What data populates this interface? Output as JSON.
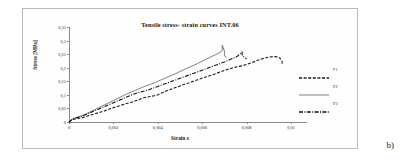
{
  "panel": {
    "label": "b)"
  },
  "chart_data": {
    "type": "line",
    "title": "Tensile stress- strain curves INT.06",
    "xlabel": "Strain ε",
    "ylabel": "Stress [MPa]",
    "xlim": [
      0,
      0.01
    ],
    "ylim": [
      0,
      0.35
    ],
    "xticks": [
      0,
      0.002,
      0.004,
      0.006,
      0.008,
      0.01
    ],
    "xtick_labels": [
      "0",
      "0,002",
      "0,004",
      "0,006",
      "0,008",
      "0,01"
    ],
    "yticks": [
      0,
      0.05,
      0.1,
      0.15,
      0.2,
      0.25,
      0.3,
      0.35
    ],
    "ytick_labels": [
      "0",
      "0,05",
      "0,1",
      "0,15",
      "0,2",
      "0,25",
      "0,3",
      "0,35"
    ],
    "grid": false,
    "legend_position": "right",
    "series": [
      {
        "name": "F1",
        "style": "dashed",
        "color": "#1a1a1a",
        "points": [
          [
            0.0,
            0.0
          ],
          [
            0.0001,
            0.006
          ],
          [
            0.0002,
            0.01
          ],
          [
            0.0004,
            0.013
          ],
          [
            0.0006,
            0.016
          ],
          [
            0.0008,
            0.021
          ],
          [
            0.001,
            0.026
          ],
          [
            0.0012,
            0.031
          ],
          [
            0.0014,
            0.036
          ],
          [
            0.0016,
            0.041
          ],
          [
            0.0018,
            0.047
          ],
          [
            0.002,
            0.053
          ],
          [
            0.0022,
            0.058
          ],
          [
            0.0024,
            0.063
          ],
          [
            0.0026,
            0.068
          ],
          [
            0.0028,
            0.072
          ],
          [
            0.003,
            0.078
          ],
          [
            0.0032,
            0.084
          ],
          [
            0.0034,
            0.09
          ],
          [
            0.0036,
            0.093
          ],
          [
            0.0038,
            0.096
          ],
          [
            0.004,
            0.1
          ],
          [
            0.0042,
            0.108
          ],
          [
            0.0044,
            0.115
          ],
          [
            0.0046,
            0.121
          ],
          [
            0.0048,
            0.127
          ],
          [
            0.005,
            0.133
          ],
          [
            0.0052,
            0.139
          ],
          [
            0.0054,
            0.144
          ],
          [
            0.0056,
            0.15
          ],
          [
            0.0058,
            0.156
          ],
          [
            0.006,
            0.162
          ],
          [
            0.0062,
            0.167
          ],
          [
            0.0064,
            0.172
          ],
          [
            0.0066,
            0.178
          ],
          [
            0.0068,
            0.184
          ],
          [
            0.007,
            0.19
          ],
          [
            0.0072,
            0.195
          ],
          [
            0.0074,
            0.2
          ],
          [
            0.0076,
            0.204
          ],
          [
            0.0078,
            0.207
          ],
          [
            0.008,
            0.212
          ],
          [
            0.0082,
            0.218
          ],
          [
            0.0084,
            0.224
          ],
          [
            0.0086,
            0.23
          ],
          [
            0.0088,
            0.235
          ],
          [
            0.009,
            0.239
          ],
          [
            0.0092,
            0.241
          ],
          [
            0.0094,
            0.24
          ],
          [
            0.0095,
            0.236
          ],
          [
            0.0096,
            0.222
          ],
          [
            0.0096,
            0.21
          ]
        ]
      },
      {
        "name": "F2",
        "style": "solid",
        "color": "#4a4a4a",
        "points": [
          [
            0.0,
            0.0
          ],
          [
            0.0001,
            0.008
          ],
          [
            0.0002,
            0.013
          ],
          [
            0.0004,
            0.018
          ],
          [
            0.0006,
            0.024
          ],
          [
            0.0008,
            0.031
          ],
          [
            0.001,
            0.039
          ],
          [
            0.0012,
            0.047
          ],
          [
            0.0014,
            0.055
          ],
          [
            0.0016,
            0.063
          ],
          [
            0.0018,
            0.071
          ],
          [
            0.002,
            0.079
          ],
          [
            0.0022,
            0.087
          ],
          [
            0.0024,
            0.095
          ],
          [
            0.0026,
            0.103
          ],
          [
            0.0028,
            0.11
          ],
          [
            0.003,
            0.117
          ],
          [
            0.0032,
            0.124
          ],
          [
            0.0034,
            0.131
          ],
          [
            0.0036,
            0.137
          ],
          [
            0.0038,
            0.143
          ],
          [
            0.004,
            0.15
          ],
          [
            0.0042,
            0.157
          ],
          [
            0.0044,
            0.164
          ],
          [
            0.0046,
            0.171
          ],
          [
            0.0048,
            0.178
          ],
          [
            0.005,
            0.186
          ],
          [
            0.0052,
            0.194
          ],
          [
            0.0054,
            0.201
          ],
          [
            0.0056,
            0.208
          ],
          [
            0.0058,
            0.216
          ],
          [
            0.006,
            0.224
          ],
          [
            0.0062,
            0.232
          ],
          [
            0.0064,
            0.24
          ],
          [
            0.0066,
            0.248
          ],
          [
            0.0068,
            0.256
          ],
          [
            0.0069,
            0.262
          ],
          [
            0.0069,
            0.283
          ],
          [
            0.007,
            0.262
          ],
          [
            0.007,
            0.244
          ],
          [
            0.0071,
            0.238
          ]
        ]
      },
      {
        "name": "F3",
        "style": "dashdot",
        "color": "#111111",
        "points": [
          [
            0.0,
            0.0
          ],
          [
            0.0001,
            0.007
          ],
          [
            0.0002,
            0.012
          ],
          [
            0.0004,
            0.017
          ],
          [
            0.0006,
            0.022
          ],
          [
            0.0008,
            0.029
          ],
          [
            0.001,
            0.036
          ],
          [
            0.0012,
            0.043
          ],
          [
            0.0014,
            0.05
          ],
          [
            0.0016,
            0.057
          ],
          [
            0.0018,
            0.064
          ],
          [
            0.002,
            0.071
          ],
          [
            0.0022,
            0.078
          ],
          [
            0.0024,
            0.085
          ],
          [
            0.0026,
            0.092
          ],
          [
            0.0028,
            0.099
          ],
          [
            0.003,
            0.105
          ],
          [
            0.0032,
            0.11
          ],
          [
            0.0034,
            0.114
          ],
          [
            0.0036,
            0.119
          ],
          [
            0.0038,
            0.125
          ],
          [
            0.004,
            0.131
          ],
          [
            0.0042,
            0.137
          ],
          [
            0.0044,
            0.143
          ],
          [
            0.0046,
            0.149
          ],
          [
            0.0048,
            0.155
          ],
          [
            0.005,
            0.161
          ],
          [
            0.0052,
            0.167
          ],
          [
            0.0054,
            0.173
          ],
          [
            0.0056,
            0.179
          ],
          [
            0.0058,
            0.185
          ],
          [
            0.006,
            0.191
          ],
          [
            0.0062,
            0.197
          ],
          [
            0.0064,
            0.203
          ],
          [
            0.0066,
            0.209
          ],
          [
            0.0068,
            0.215
          ],
          [
            0.007,
            0.221
          ],
          [
            0.0072,
            0.228
          ],
          [
            0.0074,
            0.235
          ],
          [
            0.0076,
            0.243
          ],
          [
            0.0077,
            0.251
          ],
          [
            0.0078,
            0.258
          ],
          [
            0.0078,
            0.244
          ],
          [
            0.0079,
            0.238
          ],
          [
            0.008,
            0.233
          ]
        ]
      }
    ]
  }
}
